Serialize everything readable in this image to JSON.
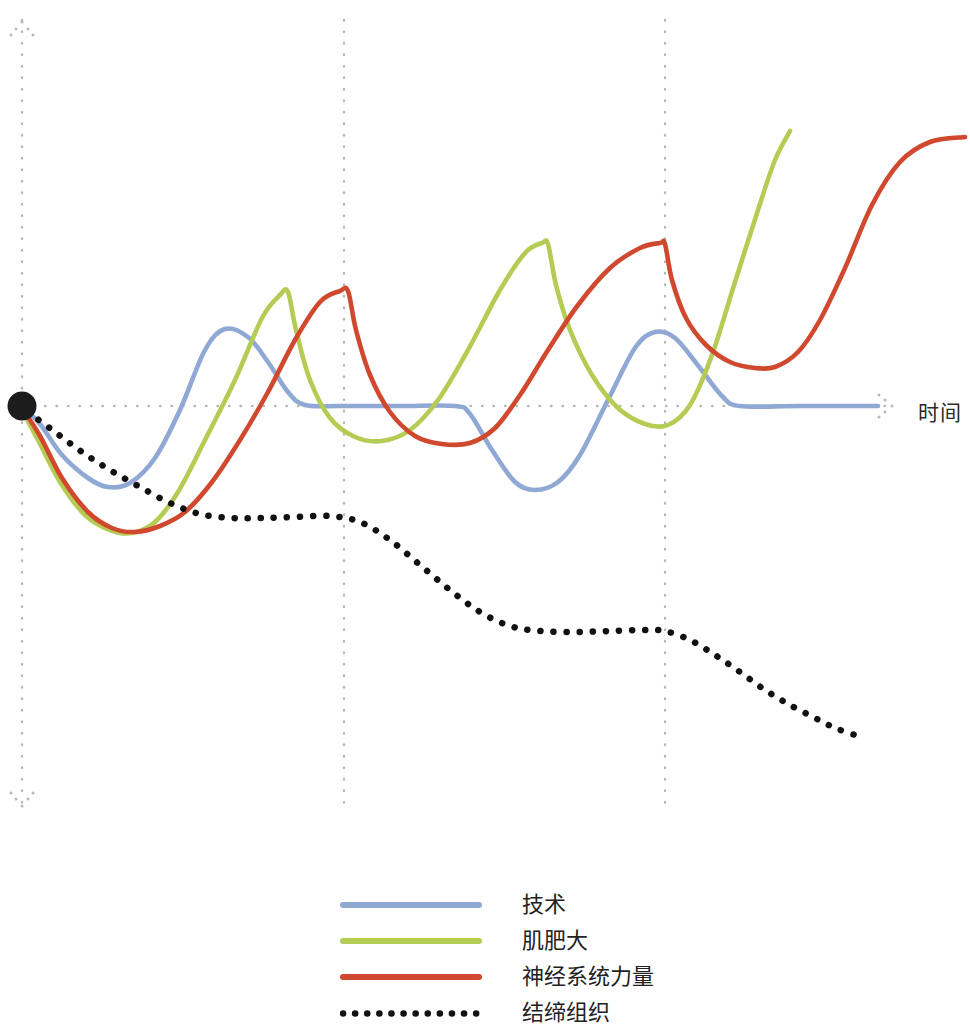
{
  "chart_data": {
    "type": "line",
    "title": "",
    "xlabel": "时间",
    "ylabel": "",
    "grid": true,
    "legend_position": "bottom",
    "axes": {
      "x_axis_style": "dotted",
      "y_axis_style": "dotted",
      "x_axis_arrow": "right",
      "y_axis_arrow": "both",
      "baseline_note": "horizontal dotted baseline at y = 0",
      "origin_marker": "filled-black-dot",
      "vertical_gridlines_x": [
        344,
        665
      ],
      "x_range_px": [
        22,
        890
      ],
      "baseline_y_px": 406
    },
    "series": [
      {
        "name": "技术",
        "color": "#8fa8d4",
        "style": "solid",
        "points": [
          [
            22,
            406
          ],
          [
            40,
            424
          ],
          [
            62,
            455
          ],
          [
            88,
            478
          ],
          [
            108,
            487
          ],
          [
            130,
            483
          ],
          [
            155,
            458
          ],
          [
            180,
            410
          ],
          [
            205,
            350
          ],
          [
            225,
            329
          ],
          [
            248,
            337
          ],
          [
            268,
            362
          ],
          [
            288,
            392
          ],
          [
            305,
            405
          ],
          [
            340,
            406
          ],
          [
            400,
            406
          ],
          [
            455,
            406
          ],
          [
            470,
            414
          ],
          [
            492,
            450
          ],
          [
            515,
            482
          ],
          [
            535,
            490
          ],
          [
            558,
            482
          ],
          [
            580,
            455
          ],
          [
            608,
            400
          ],
          [
            635,
            348
          ],
          [
            655,
            332
          ],
          [
            675,
            338
          ],
          [
            700,
            368
          ],
          [
            722,
            396
          ],
          [
            740,
            406
          ],
          [
            800,
            406
          ],
          [
            878,
            406
          ]
        ]
      },
      {
        "name": "肌肥大",
        "color": "#b5cc54",
        "style": "solid",
        "points": [
          [
            22,
            410
          ],
          [
            38,
            440
          ],
          [
            60,
            482
          ],
          [
            85,
            515
          ],
          [
            110,
            530
          ],
          [
            132,
            533
          ],
          [
            155,
            522
          ],
          [
            178,
            492
          ],
          [
            205,
            440
          ],
          [
            235,
            380
          ],
          [
            262,
            318
          ],
          [
            280,
            295
          ],
          [
            288,
            292
          ],
          [
            296,
            330
          ],
          [
            310,
            380
          ],
          [
            330,
            418
          ],
          [
            355,
            437
          ],
          [
            382,
            441
          ],
          [
            410,
            430
          ],
          [
            438,
            400
          ],
          [
            468,
            350
          ],
          [
            500,
            290
          ],
          [
            525,
            253
          ],
          [
            542,
            243
          ],
          [
            548,
            244
          ],
          [
            556,
            285
          ],
          [
            570,
            330
          ],
          [
            592,
            375
          ],
          [
            618,
            408
          ],
          [
            645,
            424
          ],
          [
            668,
            425
          ],
          [
            690,
            405
          ],
          [
            712,
            355
          ],
          [
            735,
            282
          ],
          [
            758,
            210
          ],
          [
            775,
            160
          ],
          [
            790,
            131
          ]
        ]
      },
      {
        "name": "神经系统力量",
        "color": "#d0492f",
        "style": "solid",
        "points": [
          [
            22,
            408
          ],
          [
            40,
            436
          ],
          [
            62,
            478
          ],
          [
            88,
            512
          ],
          [
            112,
            528
          ],
          [
            135,
            532
          ],
          [
            160,
            526
          ],
          [
            185,
            512
          ],
          [
            212,
            482
          ],
          [
            240,
            440
          ],
          [
            268,
            392
          ],
          [
            295,
            340
          ],
          [
            320,
            302
          ],
          [
            340,
            291
          ],
          [
            348,
            291
          ],
          [
            356,
            330
          ],
          [
            370,
            375
          ],
          [
            390,
            412
          ],
          [
            415,
            436
          ],
          [
            442,
            444
          ],
          [
            470,
            443
          ],
          [
            495,
            428
          ],
          [
            520,
            395
          ],
          [
            548,
            350
          ],
          [
            578,
            305
          ],
          [
            610,
            268
          ],
          [
            640,
            248
          ],
          [
            660,
            243
          ],
          [
            665,
            244
          ],
          [
            672,
            280
          ],
          [
            686,
            318
          ],
          [
            706,
            345
          ],
          [
            730,
            362
          ],
          [
            755,
            368
          ],
          [
            775,
            367
          ],
          [
            798,
            352
          ],
          [
            820,
            320
          ],
          [
            845,
            268
          ],
          [
            872,
            205
          ],
          [
            900,
            162
          ],
          [
            930,
            142
          ],
          [
            965,
            137
          ]
        ]
      },
      {
        "name": "结缔组织",
        "color": "#111111",
        "style": "dotted",
        "points": [
          [
            28,
            412
          ],
          [
            55,
            432
          ],
          [
            82,
            452
          ],
          [
            110,
            470
          ],
          [
            140,
            487
          ],
          [
            170,
            503
          ],
          [
            200,
            514
          ],
          [
            232,
            518
          ],
          [
            262,
            518
          ],
          [
            295,
            517
          ],
          [
            330,
            516
          ],
          [
            360,
            522
          ],
          [
            390,
            540
          ],
          [
            420,
            565
          ],
          [
            450,
            590
          ],
          [
            480,
            612
          ],
          [
            510,
            626
          ],
          [
            540,
            631
          ],
          [
            575,
            632
          ],
          [
            610,
            631
          ],
          [
            645,
            630
          ],
          [
            665,
            631
          ],
          [
            690,
            640
          ],
          [
            715,
            655
          ],
          [
            740,
            672
          ],
          [
            765,
            690
          ],
          [
            790,
            705
          ],
          [
            815,
            718
          ],
          [
            835,
            728
          ],
          [
            855,
            735
          ]
        ]
      }
    ]
  },
  "legend": {
    "items": [
      {
        "label": "技术",
        "color": "#8fa8d4",
        "style": "solid"
      },
      {
        "label": "肌肥大",
        "color": "#b5cc54",
        "style": "solid"
      },
      {
        "label": "神经系统力量",
        "color": "#d0492f",
        "style": "solid"
      },
      {
        "label": "结缔组织",
        "color": "#111111",
        "style": "dotted"
      }
    ]
  },
  "axis_labels": {
    "x": "时间"
  },
  "colors": {
    "technique": "#8fa8d4",
    "hypertrophy": "#b5cc54",
    "neural_strength": "#d0492f",
    "connective_tissue": "#111111",
    "grid": "#b9b9b4",
    "background": "#ffffff"
  }
}
